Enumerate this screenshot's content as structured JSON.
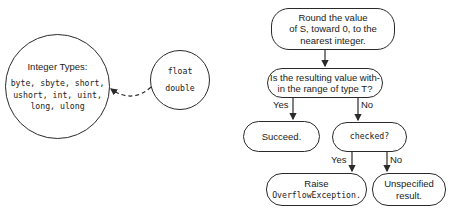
{
  "left_diagram": {
    "integer_circle": {
      "title": "Integer Types:",
      "lines": [
        "byte, sbyte, short,",
        "ushort, int, uint,",
        "long, ulong"
      ]
    },
    "float_circle": {
      "lines": [
        "float",
        "double"
      ]
    },
    "arrow": {
      "style": "dashed",
      "from": "float_circle",
      "to": "integer_circle"
    }
  },
  "flowchart": {
    "round_node": {
      "lines": [
        "Round the value",
        "of S, toward 0, to the",
        "nearest integer."
      ]
    },
    "range_node": {
      "lines": [
        "Is the resulting value with-",
        "in the range of type T?"
      ]
    },
    "range_yes_label": "Yes",
    "range_no_label": "No",
    "succeed_node": {
      "lines": [
        "Succeed."
      ]
    },
    "checked_node": {
      "lines": [
        "checked?"
      ]
    },
    "checked_yes_label": "Yes",
    "checked_no_label": "No",
    "raise_node": {
      "lines": [
        "Raise",
        "OverflowException."
      ]
    },
    "unspecified_node": {
      "lines": [
        "Unspecified",
        "result."
      ]
    }
  },
  "colors": {
    "stroke": "#2a2a2a",
    "text": "#222222",
    "background": "#ffffff"
  }
}
